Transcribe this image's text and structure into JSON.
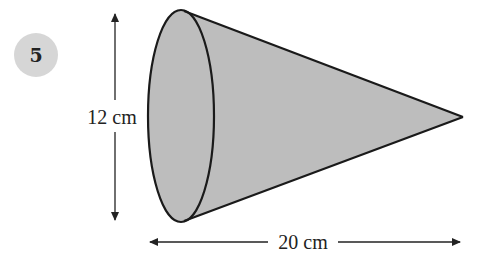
{
  "question": {
    "number": "5",
    "badge_color": "#d6d6d6"
  },
  "figure": {
    "shape": "cone",
    "fill_color": "#bdbdbd",
    "stroke_color": "#1a1a1a",
    "height_label": "12 cm",
    "length_label": "20 cm"
  }
}
